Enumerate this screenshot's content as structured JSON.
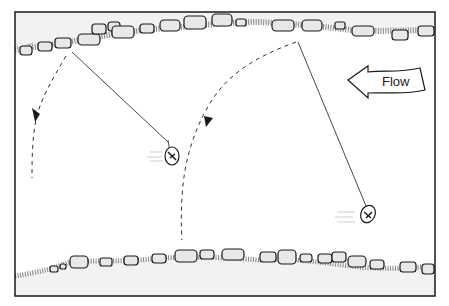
{
  "diagram": {
    "colors": {
      "background": "#ffffff",
      "bank": "#f2f2f2",
      "ink": "#1a1a1a",
      "rock_fill": "#e8e8e8",
      "gravel": "#555555"
    },
    "flow_arrow": {
      "label": "Flow",
      "direction": "left"
    },
    "elements": [
      {
        "id": "far-bank",
        "label": "far bank with rocks"
      },
      {
        "id": "near-bank",
        "label": "near bank with rocks"
      },
      {
        "id": "cast-left",
        "label": "line and lure, left position",
        "swing_arrow": "dashed arc downstream"
      },
      {
        "id": "cast-right",
        "label": "line and lure, right position",
        "swing_arrow": "dashed arc downstream"
      }
    ]
  }
}
